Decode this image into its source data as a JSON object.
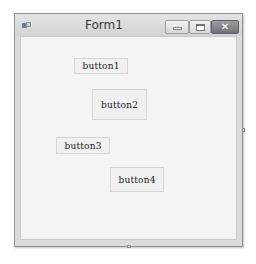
{
  "window": {
    "title": "Form1",
    "icon": "form-app-icon",
    "controls": {
      "minimize": "minimize-icon",
      "maximize": "maximize-icon",
      "close": "close-icon",
      "close_glyph": "✕"
    }
  },
  "form": {
    "buttons": [
      {
        "label": "button1"
      },
      {
        "label": "button2"
      },
      {
        "label": "button3"
      },
      {
        "label": "button4"
      }
    ]
  },
  "colors": {
    "titlebar": "#d9dadc",
    "client_background": "#f4f4f4",
    "button_face": "#f0f0f0",
    "close_button": "#7e8186"
  }
}
